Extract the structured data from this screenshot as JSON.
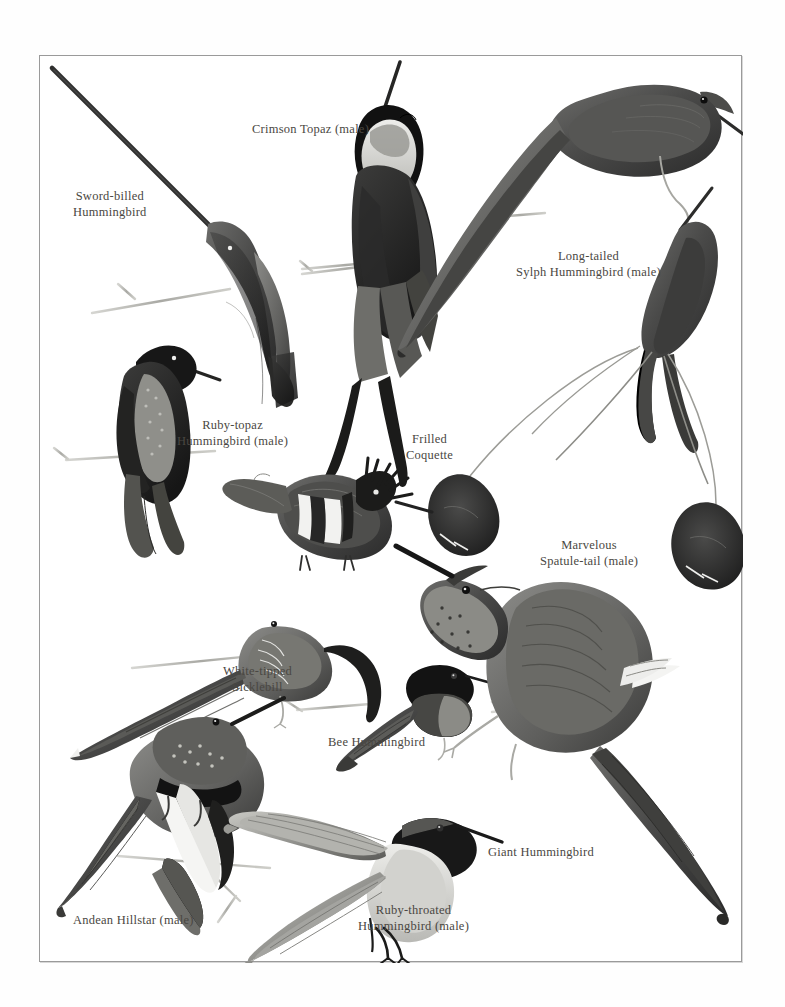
{
  "plate": {
    "kind": "book-plate-illustration",
    "subject": "hummingbird species",
    "background_color": "#ffffff",
    "frame_color": "#9a9a9a",
    "label_color": "#4a4742",
    "ink_color": "#3b3b3b"
  },
  "labels": {
    "sword_billed": {
      "line1": "Sword-billed",
      "line2": "Hummingbird"
    },
    "crimson_topaz": {
      "line1": "Crimson Topaz (male)"
    },
    "long_tailed_sylph": {
      "line1": "Long-tailed",
      "line2": "Sylph Hummingbird (male)"
    },
    "ruby_topaz": {
      "line1": "Ruby-topaz",
      "line2": "Hummingbird (male)"
    },
    "frilled_coquette": {
      "line1": "Frilled",
      "line2": "Coquette"
    },
    "marvelous_spatuletail": {
      "line1": "Marvelous",
      "line2": "Spatule-tail (male)"
    },
    "white_tipped_sicklebill": {
      "line1": "White-tipped",
      "line2": "Sicklebill"
    },
    "bee_hummingbird": {
      "line1": "Bee Hummingbird"
    },
    "giant_hummingbird": {
      "line1": "Giant Hummingbird"
    },
    "andean_hillstar": {
      "line1": "Andean Hillstar (male)"
    },
    "ruby_throated": {
      "line1": "Ruby-throated",
      "line2": "Hummingbird (male)"
    }
  },
  "figures": [
    {
      "name": "sword-billed-hummingbird",
      "pose": "perched, bill pointing up-left, extremely long straight bill"
    },
    {
      "name": "crimson-topaz",
      "pose": "perched upright, white throat patch, long crossed tail streamers"
    },
    {
      "name": "long-tailed-sylph",
      "pose": "perched, very long forked tail sweeping down-left"
    },
    {
      "name": "ruby-topaz-hummingbird",
      "pose": "perched on twig facing right"
    },
    {
      "name": "frilled-coquette",
      "pose": "perched, crest raised, barred flank plumage"
    },
    {
      "name": "marvelous-spatuletail",
      "pose": "perched upper-right with two long racket-tipped tail wires"
    },
    {
      "name": "white-tipped-sicklebill",
      "pose": "perched, strongly decurved bill"
    },
    {
      "name": "bee-hummingbird",
      "pose": "small, perched on thin twig"
    },
    {
      "name": "giant-hummingbird",
      "pose": "large, perched, speckled throat, white rump band"
    },
    {
      "name": "andean-hillstar",
      "pose": "perched, black gorget band and white breast"
    },
    {
      "name": "ruby-throated-hummingbird",
      "pose": "hovering in flight, wings spread"
    }
  ]
}
